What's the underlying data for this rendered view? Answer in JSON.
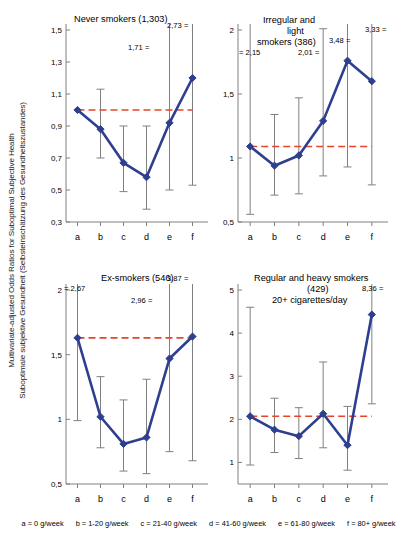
{
  "figure": {
    "ylabel_line1": "Multivariate-adjusted Odds Ratios for Suboptimal Subjective Health",
    "ylabel_line2": "Suboptimale subjektive Gesundheit (Selbsteinschätzung des Gesundheitszustandes)",
    "legend_items": [
      "a = 0 g/week",
      "b = 1-20 g/week",
      "c = 21-40 g/week",
      "d = 41-60 g/week",
      "e = 61-80 g/week",
      "f = 80+ g/week"
    ]
  },
  "chart_data": [
    {
      "type": "line",
      "panel_index": 0,
      "title": "Never smokers (1,303)",
      "subtitle": "",
      "categories": [
        "a",
        "b",
        "c",
        "d",
        "e",
        "f"
      ],
      "values": [
        1.0,
        0.88,
        0.67,
        0.58,
        0.92,
        1.2
      ],
      "ci_low": [
        1.0,
        0.7,
        0.49,
        0.38,
        0.5,
        0.53
      ],
      "ci_high": [
        1.0,
        1.13,
        0.9,
        0.9,
        1.71,
        2.73
      ],
      "reference_line": 1.0,
      "ylim": [
        0.3,
        1.5
      ],
      "yticks": [
        "0,3",
        "0,5",
        "0,7",
        "0,9",
        "1,1",
        "1,3",
        "1,5"
      ],
      "ytick_values": [
        0.3,
        0.5,
        0.7,
        0.9,
        1.1,
        1.3,
        1.5
      ],
      "annotations": [
        {
          "text": "1,71 =",
          "category": "e"
        },
        {
          "text": "2,73 =",
          "category": "f"
        }
      ],
      "xlabel": "",
      "ylabel": "",
      "grid": false
    },
    {
      "type": "line",
      "panel_index": 1,
      "title": "Irregular and light smokers (386)",
      "subtitle": "",
      "categories": [
        "a",
        "b",
        "c",
        "d",
        "e",
        "f"
      ],
      "values": [
        1.09,
        0.94,
        1.02,
        1.29,
        1.76,
        1.6
      ],
      "ci_low": [
        0.56,
        0.71,
        0.72,
        0.86,
        0.93,
        0.79
      ],
      "ci_high": [
        2.15,
        1.34,
        1.47,
        2.01,
        3.48,
        3.33
      ],
      "reference_line": 1.09,
      "ylim": [
        0.5,
        2.0
      ],
      "yticks": [
        "0,5",
        "1",
        "1,5",
        "2"
      ],
      "ytick_values": [
        0.5,
        1.0,
        1.5,
        2.0
      ],
      "annotations": [
        {
          "text": "= 2,15",
          "category": "a"
        },
        {
          "text": "2,01 =",
          "category": "d"
        },
        {
          "text": "3,48 =",
          "category": "e"
        },
        {
          "text": "3,33 =",
          "category": "f"
        }
      ],
      "xlabel": "",
      "ylabel": "",
      "grid": false
    },
    {
      "type": "line",
      "panel_index": 2,
      "title": "Ex-smokers (546)",
      "subtitle": "",
      "categories": [
        "a",
        "b",
        "c",
        "d",
        "e",
        "f"
      ],
      "values": [
        1.63,
        1.02,
        0.81,
        0.86,
        1.47,
        1.64
      ],
      "ci_low": [
        0.99,
        0.78,
        0.6,
        0.58,
        0.75,
        0.68
      ],
      "ci_high": [
        2.67,
        1.33,
        1.15,
        1.31,
        2.96,
        3.87
      ],
      "reference_line": 1.63,
      "ylim": [
        0.5,
        2.0
      ],
      "yticks": [
        "0,5",
        "1",
        "1,5",
        "2"
      ],
      "ytick_values": [
        0.5,
        1.0,
        1.5,
        2.0
      ],
      "annotations": [
        {
          "text": "= 2,67",
          "category": "a"
        },
        {
          "text": "2,96 =",
          "category": "e"
        },
        {
          "text": "3,87 =",
          "category": "f"
        }
      ],
      "xlabel": "",
      "ylabel": "",
      "grid": false
    },
    {
      "type": "line",
      "panel_index": 3,
      "title": "Regular and heavy smokers (429)",
      "subtitle": "20+ cigarettes/day",
      "categories": [
        "a",
        "b",
        "c",
        "d",
        "e",
        "f"
      ],
      "values": [
        2.07,
        1.76,
        1.61,
        2.13,
        1.4,
        4.43
      ],
      "ci_low": [
        0.94,
        1.23,
        1.09,
        1.34,
        0.82,
        2.36
      ],
      "ci_high": [
        4.6,
        2.49,
        2.27,
        3.33,
        2.3,
        8.36
      ],
      "reference_line": 2.07,
      "ylim": [
        0.5,
        5.0
      ],
      "yticks": [
        "1",
        "2",
        "3",
        "4",
        "5"
      ],
      "ytick_values": [
        1,
        2,
        3,
        4,
        5
      ],
      "annotations": [
        {
          "text": "8,36 =",
          "category": "f"
        }
      ],
      "xlabel": "",
      "ylabel": "",
      "grid": false
    }
  ],
  "style": {
    "series_color": "#2e3f8f",
    "reference_color": "#e8442a",
    "errorbar_color": "#808080",
    "axis_color": "#808080"
  },
  "panel_titles": {
    "p0": "Never smokers (1,303)",
    "p1_l1": "Irregular and",
    "p1_l2": "light",
    "p1_l3": "smokers (386)",
    "p2": "Ex-smokers (546)",
    "p3_l1": "Regular and heavy smokers",
    "p3_l2": "(429)",
    "p3_l3": "20+ cigarettes/day"
  }
}
